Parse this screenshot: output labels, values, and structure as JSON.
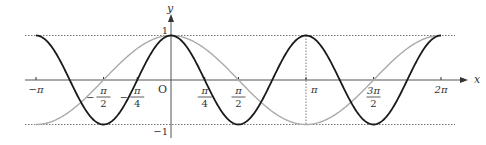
{
  "chart_data": {
    "type": "line",
    "title": "",
    "xlabel": "x",
    "ylabel": "y",
    "xlim": [
      -3.3,
      6.6
    ],
    "ylim": [
      -1.2,
      1.4
    ],
    "grid": false,
    "origin_label": "O",
    "x_ticks": [
      {
        "value": -3.14159,
        "label": "−π"
      },
      {
        "value": -1.5708,
        "num": "π",
        "den": "2",
        "sign": "−"
      },
      {
        "value": -0.7854,
        "num": "π",
        "den": "4",
        "sign": "−"
      },
      {
        "value": 0.7854,
        "num": "π",
        "den": "4",
        "sign": ""
      },
      {
        "value": 1.5708,
        "num": "π",
        "den": "2",
        "sign": ""
      },
      {
        "value": 3.14159,
        "label": "π"
      },
      {
        "value": 4.7124,
        "num": "3π",
        "den": "2",
        "sign": ""
      },
      {
        "value": 6.28318,
        "label": "2π"
      }
    ],
    "y_ticks": [
      {
        "value": 1,
        "label": "1"
      },
      {
        "value": -1,
        "label": "−1"
      }
    ],
    "series": [
      {
        "name": "y = cos 2x",
        "function": "cos(2x)",
        "domain": [
          -3.14159,
          6.28318
        ],
        "color": "#1a1a1a"
      },
      {
        "name": "y = cos x",
        "function": "cos(x)",
        "domain": [
          -3.14159,
          6.28318
        ],
        "color": "#aaaaaa"
      }
    ],
    "reference_lines": [
      {
        "type": "horizontal",
        "y": 1,
        "style": "dotted"
      },
      {
        "type": "horizontal",
        "y": -1,
        "style": "dotted"
      },
      {
        "type": "vertical",
        "x": 3.14159,
        "style": "dotted"
      }
    ]
  }
}
